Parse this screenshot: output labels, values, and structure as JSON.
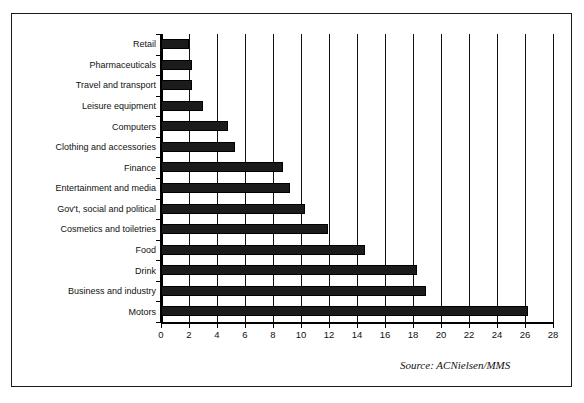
{
  "figure": {
    "title": "",
    "source_note": "Source: ACNielsen/MMS",
    "frame_color": "#1a1a1a",
    "bar_color": "#1b1b1b"
  },
  "chart_data": {
    "type": "bar",
    "orientation": "horizontal",
    "title": "",
    "xlabel": "",
    "ylabel": "",
    "xlim": [
      0,
      28
    ],
    "xticks": [
      0,
      2,
      4,
      6,
      8,
      10,
      12,
      14,
      16,
      18,
      20,
      22,
      24,
      26,
      28
    ],
    "grid": "vertical",
    "legend": "none",
    "categories": [
      "Retail",
      "Pharmaceuticals",
      "Travel and transport",
      "Leisure equipment",
      "Computers",
      "Clothing and accessories",
      "Finance",
      "Entertainment and media",
      "Gov't, social and political",
      "Cosmetics and toiletries",
      "Food",
      "Drink",
      "Business and industry",
      "Motors"
    ],
    "values": [
      2.0,
      2.2,
      2.2,
      3.0,
      4.8,
      5.3,
      8.7,
      9.2,
      10.3,
      11.9,
      14.6,
      18.3,
      18.9,
      26.2
    ]
  }
}
